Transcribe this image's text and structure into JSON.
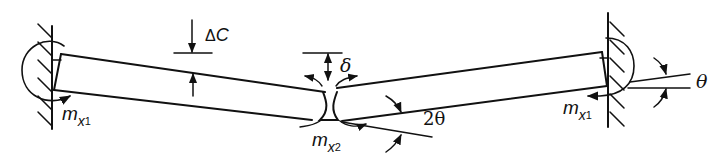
{
  "diagram": {
    "type": "fixed-fixed beam with central hinge deflection / plastic hinge mechanism",
    "colors": {
      "line": "#111111",
      "background": "#ffffff"
    },
    "labels": {
      "delta_c": {
        "symbol": "Δ",
        "var": "C"
      },
      "delta": "δ",
      "theta": "θ",
      "two_theta": "2θ",
      "moment_left": {
        "m": "m",
        "x": "x",
        "sub": "1"
      },
      "moment_center": {
        "m": "m",
        "x": "x",
        "sub": "2"
      },
      "moment_right": {
        "m": "m",
        "x": "x",
        "sub": "1"
      }
    }
  }
}
